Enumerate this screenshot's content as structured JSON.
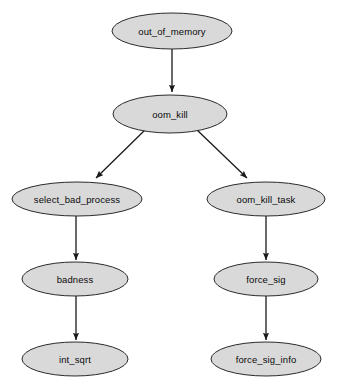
{
  "diagram": {
    "type": "call-graph",
    "background_color": "#ffffff",
    "node_fill_color": "#d9d9d9",
    "node_stroke_color": "#2b2b2b",
    "edge_color": "#1a1a1a",
    "text_color": "#0a0a0a",
    "nodes": [
      {
        "id": "out_of_memory",
        "label": "out_of_memory",
        "cx": 172,
        "cy": 31,
        "rx": 60,
        "ry": 18
      },
      {
        "id": "oom_kill",
        "label": "oom_kill",
        "cx": 170,
        "cy": 114,
        "rx": 57,
        "ry": 19
      },
      {
        "id": "select_bad_process",
        "label": "select_bad_process",
        "cx": 77,
        "cy": 199,
        "rx": 65,
        "ry": 17
      },
      {
        "id": "oom_kill_task",
        "label": "oom_kill_task",
        "cx": 266,
        "cy": 199,
        "rx": 59,
        "ry": 17
      },
      {
        "id": "badness",
        "label": "badness",
        "cx": 75,
        "cy": 279,
        "rx": 53,
        "ry": 17
      },
      {
        "id": "force_sig",
        "label": "force_sig",
        "cx": 266,
        "cy": 279,
        "rx": 52,
        "ry": 17
      },
      {
        "id": "int_sqrt",
        "label": "int_sqrt",
        "cx": 75,
        "cy": 359,
        "rx": 53,
        "ry": 17
      },
      {
        "id": "force_sig_info",
        "label": "force_sig_info",
        "cx": 266,
        "cy": 359,
        "rx": 55,
        "ry": 17
      }
    ],
    "edges": [
      {
        "id": "e1",
        "from": "out_of_memory",
        "to": "oom_kill",
        "x1": 172,
        "y1": 49,
        "x2": 172,
        "y2": 92
      },
      {
        "id": "e2",
        "from": "oom_kill",
        "to": "select_bad_process",
        "x1": 146,
        "y1": 129,
        "x2": 96,
        "y2": 178
      },
      {
        "id": "e3",
        "from": "oom_kill",
        "to": "oom_kill_task",
        "x1": 196,
        "y1": 129,
        "x2": 247,
        "y2": 178
      },
      {
        "id": "e4",
        "from": "select_bad_process",
        "to": "badness",
        "x1": 76,
        "y1": 216,
        "x2": 76,
        "y2": 260
      },
      {
        "id": "e5",
        "from": "badness",
        "to": "int_sqrt",
        "x1": 76,
        "y1": 296,
        "x2": 76,
        "y2": 340
      },
      {
        "id": "e6",
        "from": "oom_kill_task",
        "to": "force_sig",
        "x1": 266,
        "y1": 216,
        "x2": 266,
        "y2": 260
      },
      {
        "id": "e7",
        "from": "force_sig",
        "to": "force_sig_info",
        "x1": 266,
        "y1": 296,
        "x2": 266,
        "y2": 340
      }
    ]
  }
}
